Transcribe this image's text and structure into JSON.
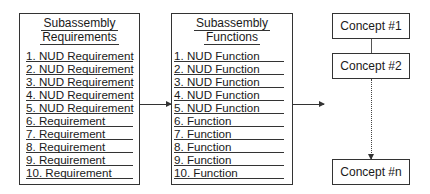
{
  "requirements": {
    "title_line1": "Subassembly",
    "title_line2": "Requirements",
    "items": [
      "1. NUD Requirement",
      "2. NUD Requirement",
      "3. NUD Requirement",
      "4. NUD Requirement",
      "5. NUD Requirement",
      "6. Requirement",
      "7. Requirement",
      "8. Requirement",
      "9. Requirement",
      "10. Requirement"
    ]
  },
  "functions": {
    "title_line1": "Subassembly",
    "title_line2": "Functions",
    "items": [
      "1. NUD Function",
      "2. NUD Function",
      "3. NUD Function",
      "4. NUD Function",
      "5. NUD Function",
      "6. Function",
      "7. Function",
      "8. Function",
      "9. Function",
      "10. Function"
    ]
  },
  "concepts": {
    "first": "Concept #1",
    "second": "Concept #2",
    "last": "Concept #n"
  },
  "colors": {
    "line": "#333333",
    "background": "#ffffff"
  }
}
